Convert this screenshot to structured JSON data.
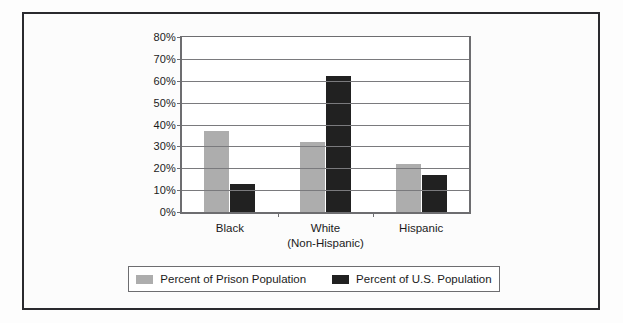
{
  "chart_data": {
    "type": "bar",
    "title": "",
    "subtitle": "",
    "xlabel": "",
    "ylabel": "",
    "categories": [
      "Black",
      "White\n(Non-Hispanic)",
      "Hispanic"
    ],
    "category_lines": [
      [
        "Black"
      ],
      [
        "White",
        "(Non-Hispanic)"
      ],
      [
        "Hispanic"
      ]
    ],
    "series": [
      {
        "name": "Percent of Prison Population",
        "color": "#adadad",
        "values": [
          37,
          32,
          22
        ]
      },
      {
        "name": "Percent of U.S. Population",
        "color": "#212121",
        "values": [
          13,
          62,
          17
        ]
      }
    ],
    "ylim": [
      0,
      80
    ],
    "ytick_values": [
      0,
      10,
      20,
      30,
      40,
      50,
      60,
      70,
      80
    ],
    "ytick_labels": [
      "0%",
      "10%",
      "20%",
      "30%",
      "40%",
      "50%",
      "60%",
      "70%",
      "80%"
    ],
    "grid": true,
    "grid_axis": "y",
    "legend_position": "bottom",
    "value_unit": "%"
  },
  "style": {
    "frame_border_color": "#2a2a2e",
    "axis_color": "#6d6d70",
    "grid_color": "#7a7a7d",
    "background_color": "#fcfcfc",
    "text_color": "#1b1b1b"
  }
}
